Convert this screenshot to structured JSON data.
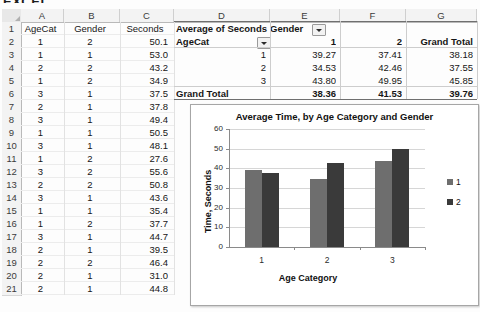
{
  "clipped_header": "EXCEL",
  "sheet": {
    "column_headers": [
      "A",
      "B",
      "C",
      "D",
      "E",
      "F",
      "G"
    ],
    "row_numbers": [
      1,
      2,
      3,
      4,
      5,
      6,
      7,
      8,
      9,
      10,
      11,
      12,
      13,
      14,
      15,
      16,
      17,
      18,
      19,
      20,
      21
    ],
    "data_headers": [
      "AgeCat",
      "Gender",
      "Seconds"
    ],
    "data_rows": [
      {
        "agecat": "1",
        "gender": "2",
        "seconds": "50.1"
      },
      {
        "agecat": "1",
        "gender": "1",
        "seconds": "53.0"
      },
      {
        "agecat": "2",
        "gender": "2",
        "seconds": "43.2"
      },
      {
        "agecat": "1",
        "gender": "2",
        "seconds": "34.9"
      },
      {
        "agecat": "3",
        "gender": "1",
        "seconds": "37.5"
      },
      {
        "agecat": "2",
        "gender": "1",
        "seconds": "37.8"
      },
      {
        "agecat": "3",
        "gender": "1",
        "seconds": "49.4"
      },
      {
        "agecat": "1",
        "gender": "1",
        "seconds": "50.5"
      },
      {
        "agecat": "3",
        "gender": "1",
        "seconds": "48.1"
      },
      {
        "agecat": "1",
        "gender": "2",
        "seconds": "27.6"
      },
      {
        "agecat": "3",
        "gender": "2",
        "seconds": "55.6"
      },
      {
        "agecat": "2",
        "gender": "2",
        "seconds": "50.8"
      },
      {
        "agecat": "3",
        "gender": "1",
        "seconds": "43.6"
      },
      {
        "agecat": "1",
        "gender": "1",
        "seconds": "35.4"
      },
      {
        "agecat": "1",
        "gender": "2",
        "seconds": "37.7"
      },
      {
        "agecat": "3",
        "gender": "1",
        "seconds": "44.7"
      },
      {
        "agecat": "2",
        "gender": "1",
        "seconds": "39.5"
      },
      {
        "agecat": "2",
        "gender": "2",
        "seconds": "46.4"
      },
      {
        "agecat": "2",
        "gender": "1",
        "seconds": "31.0"
      },
      {
        "agecat": "2",
        "gender": "1",
        "seconds": "44.8"
      }
    ]
  },
  "pivot": {
    "value_field_label": "Average of Seconds",
    "column_field_label": "Gender",
    "row_field_label": "AgeCat",
    "column_headers": [
      "1",
      "2",
      "Grand Total"
    ],
    "rows": [
      {
        "label": "1",
        "g1": "39.27",
        "g2": "37.41",
        "total": "38.18"
      },
      {
        "label": "2",
        "g1": "34.53",
        "g2": "42.46",
        "total": "37.55"
      },
      {
        "label": "3",
        "g1": "43.80",
        "g2": "49.95",
        "total": "45.85"
      }
    ],
    "grand_total": {
      "label": "Grand Total",
      "g1": "38.36",
      "g2": "41.53",
      "total": "39.76"
    }
  },
  "chart_data": {
    "type": "bar",
    "title": "Average Time, by Age Category and Gender",
    "xlabel": "Age Category",
    "ylabel": "Time, Seconds",
    "categories": [
      "1",
      "2",
      "3"
    ],
    "series": [
      {
        "name": "1",
        "values": [
          39.27,
          34.53,
          43.8
        ],
        "color": "#6e6e6e"
      },
      {
        "name": "2",
        "values": [
          37.41,
          42.46,
          49.95
        ],
        "color": "#3a3a3a"
      }
    ],
    "ylim": [
      0,
      60
    ],
    "yticks": [
      "0",
      "10",
      "20",
      "30",
      "40",
      "50",
      "60"
    ],
    "grid": true,
    "legend_position": "right"
  }
}
